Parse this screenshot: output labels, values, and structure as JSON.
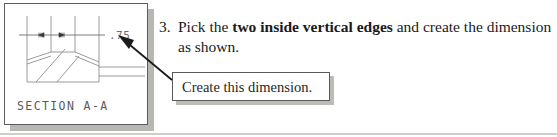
{
  "figure": {
    "dimension_value": ".75",
    "section_label": "SECTION  A-A",
    "frame_color": "#5d5d5d",
    "line_color": "#8e8e8e",
    "shadow_color": "#b9b7b4"
  },
  "instruction": {
    "number": "3.",
    "text_before_bold": "Pick the ",
    "bold_text": "two inside vertical edges",
    "text_after_bold": " and create the dimension as shown."
  },
  "callout": {
    "label": "Create this dimension.",
    "border_color": "#5a5a5a",
    "shadow_color": "#bdbbb8"
  },
  "leader": {
    "arrow_color": "#1c1c1c"
  }
}
